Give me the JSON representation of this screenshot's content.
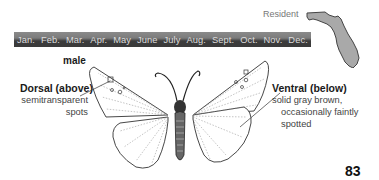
{
  "range": {
    "label": "Resident",
    "map_region": "Florida"
  },
  "flight_calendar": {
    "months": [
      "Jan.",
      "Feb.",
      "Mar.",
      "Apr.",
      "May",
      "June",
      "July",
      "Aug.",
      "Sept.",
      "Oct.",
      "Nov.",
      "Dec."
    ]
  },
  "illustration": {
    "sex_label": "male",
    "dorsal": {
      "title": "Dorsal (above)",
      "description": "semitransparent spots"
    },
    "ventral": {
      "title": "Ventral (below)",
      "description_line1": "solid gray brown,",
      "description_line2": "occasionally faintly",
      "description_line3": "spotted"
    }
  },
  "page": {
    "number": "83"
  }
}
